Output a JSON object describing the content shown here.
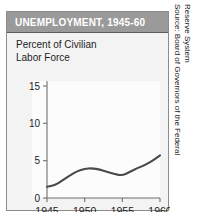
{
  "card": {
    "title": "UNEMPLOYMENT, 1945-60",
    "subtitle": "Percent of Civilian\nLabor Force"
  },
  "source": {
    "line1": "Source: Board of Governors of the Federal",
    "line2": "Reserve System"
  },
  "colors": {
    "title_bar": "#9a9a9a",
    "title_text": "#ffffff",
    "card_bg": "#f3f3f3",
    "plot_bg": "#fcfcfc",
    "axis": "#6e6e6e",
    "line": "#4a4a4a",
    "border": "#8c8c8c"
  },
  "chart_data": {
    "type": "line",
    "title": "UNEMPLOYMENT, 1945-60",
    "subtitle": "Percent of Civilian Labor Force",
    "xlabel": "",
    "ylabel": "Percent of Civilian Labor Force",
    "xlim": [
      1945,
      1960
    ],
    "ylim": [
      0,
      15
    ],
    "xticks": [
      1945,
      1950,
      1955,
      1960
    ],
    "xticklabels": [
      "1945",
      "1950",
      "1955",
      "1960"
    ],
    "yticks": [
      0,
      5,
      10,
      15
    ],
    "yticklabels": [
      "0",
      "5",
      "10",
      "15"
    ],
    "grid": false,
    "legend": null,
    "series": [
      {
        "name": "Unemployment rate",
        "x": [
          1945,
          1946,
          1947,
          1948,
          1949,
          1950,
          1951,
          1952,
          1953,
          1954,
          1955,
          1956,
          1957,
          1958,
          1959,
          1960
        ],
        "values": [
          1.5,
          1.7,
          2.3,
          3.0,
          3.6,
          3.9,
          4.0,
          3.8,
          3.5,
          3.2,
          3.0,
          3.5,
          4.0,
          4.4,
          5.0,
          5.7
        ]
      }
    ]
  }
}
